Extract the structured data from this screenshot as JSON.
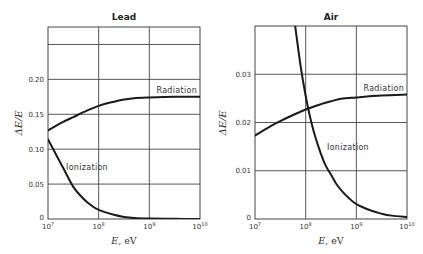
{
  "chart_data": [
    {
      "type": "line",
      "title": "Lead",
      "xlabel": "E, eV",
      "xlabel_var": "E",
      "xlabel_unit": "eV",
      "ylabel": "ΔE/E",
      "xscale": "log",
      "xlim": [
        10000000.0,
        10000000000.0
      ],
      "ylim": [
        0,
        0.275
      ],
      "grid": true,
      "x_ticks": [
        {
          "base": "10",
          "exp": "7",
          "value": 10000000.0
        },
        {
          "base": "10",
          "exp": "8",
          "value": 100000000.0
        },
        {
          "base": "10",
          "exp": "9",
          "value": 1000000000.0
        },
        {
          "base": "10",
          "exp": "10",
          "value": 10000000000.0
        }
      ],
      "y_ticks": [
        {
          "label": "0",
          "value": 0
        },
        {
          "label": "0.05",
          "value": 0.05
        },
        {
          "label": "0.10",
          "value": 0.1
        },
        {
          "label": "0.15",
          "value": 0.15
        },
        {
          "label": "0.20",
          "value": 0.2
        }
      ],
      "y_gridlines": [
        0.05,
        0.1,
        0.15,
        0.2,
        0.25
      ],
      "series": [
        {
          "name": "Radiation",
          "x": [
            10000000.0,
            20000000.0,
            31600000.0,
            50000000.0,
            100000000.0,
            200000000.0,
            316000000.0,
            500000000.0,
            1000000000.0,
            3160000000.0,
            10000000000.0
          ],
          "y": [
            0.127,
            0.139,
            0.146,
            0.153,
            0.162,
            0.168,
            0.171,
            0.173,
            0.174,
            0.175,
            0.175
          ]
        },
        {
          "name": "Ionization",
          "x": [
            10000000.0,
            15000000.0,
            20000000.0,
            31600000.0,
            50000000.0,
            70000000.0,
            100000000.0,
            200000000.0,
            316000000.0,
            500000000.0,
            1000000000.0,
            3160000000.0,
            10000000000.0
          ],
          "y": [
            0.114,
            0.09,
            0.073,
            0.046,
            0.029,
            0.02,
            0.013,
            0.006,
            0.003,
            0.0015,
            0.0007,
            0.0002,
            0.0
          ]
        }
      ],
      "annotations": [
        {
          "text": "Radiation",
          "series": "Radiation"
        },
        {
          "text": "Ionization",
          "series": "Ionization"
        }
      ]
    },
    {
      "type": "line",
      "title": "Air",
      "xlabel": "E, eV",
      "xlabel_var": "E",
      "xlabel_unit": "eV",
      "ylabel": "ΔE/E",
      "xscale": "log",
      "xlim": [
        10000000.0,
        10000000000.0
      ],
      "ylim": [
        0,
        0.04
      ],
      "grid": true,
      "x_ticks": [
        {
          "base": "10",
          "exp": "7",
          "value": 10000000.0
        },
        {
          "base": "10",
          "exp": "8",
          "value": 100000000.0
        },
        {
          "base": "10",
          "exp": "9",
          "value": 1000000000.0
        },
        {
          "base": "10",
          "exp": "10",
          "value": 10000000000.0
        }
      ],
      "y_ticks": [
        {
          "label": "0",
          "value": 0
        },
        {
          "label": "0.01",
          "value": 0.01
        },
        {
          "label": "0.02",
          "value": 0.02
        },
        {
          "label": "0.03",
          "value": 0.03
        }
      ],
      "y_gridlines": [
        0.01,
        0.02,
        0.03
      ],
      "series": [
        {
          "name": "Radiation",
          "x": [
            10000000.0,
            20000000.0,
            31600000.0,
            50000000.0,
            100000000.0,
            200000000.0,
            316000000.0,
            500000000.0,
            1000000000.0,
            3160000000.0,
            10000000000.0
          ],
          "y": [
            0.0173,
            0.0192,
            0.0203,
            0.0213,
            0.0227,
            0.0238,
            0.0244,
            0.0249,
            0.0252,
            0.0256,
            0.0258
          ]
        },
        {
          "name": "Ionization",
          "x": [
            62000000.0,
            80000000.0,
            100000000.0,
            120000000.0,
            150000000.0,
            200000000.0,
            250000000.0,
            316000000.0,
            400000000.0,
            500000000.0,
            700000000.0,
            1000000000.0,
            2000000000.0,
            3160000000.0,
            5000000000.0,
            10000000000.0
          ],
          "y": [
            0.04,
            0.0315,
            0.0255,
            0.0215,
            0.0175,
            0.0135,
            0.011,
            0.0092,
            0.0073,
            0.006,
            0.0044,
            0.0031,
            0.0017,
            0.0011,
            0.0007,
            0.0004
          ]
        }
      ],
      "annotations": [
        {
          "text": "Radiation",
          "series": "Radiation"
        },
        {
          "text": "Ionization",
          "series": "Ionization"
        }
      ]
    }
  ]
}
